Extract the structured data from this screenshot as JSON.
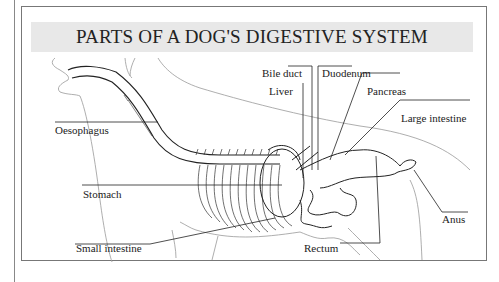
{
  "title": "PARTS OF A DOG'S DIGESTIVE SYSTEM",
  "labels": {
    "oesophagus": "Oesophagus",
    "stomach": "Stomach",
    "small_intestine": "Small intestine",
    "bile_duct": "Bile duct",
    "liver": "Liver",
    "duodenum": "Duodenum",
    "pancreas": "Pancreas",
    "large_intestine": "Large intestine",
    "rectum": "Rectum",
    "anus": "Anus"
  },
  "colors": {
    "title_band": "#e8e8e8",
    "ink": "#222222",
    "outline": "#999999"
  }
}
